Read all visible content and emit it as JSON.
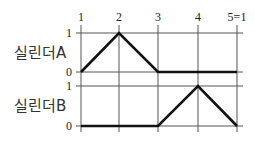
{
  "diagram": {
    "type": "displacement-step-diagram",
    "steps": [
      "1",
      "2",
      "3",
      "4",
      "5=1"
    ],
    "cylinders": [
      {
        "name": "실린더A",
        "levels": {
          "high": "1",
          "low": "0"
        },
        "states": [
          0,
          1,
          0,
          0,
          0
        ]
      },
      {
        "name": "실린더B",
        "levels": {
          "high": "1",
          "low": "0"
        },
        "states": [
          0,
          0,
          0,
          1,
          0
        ]
      }
    ],
    "colors": {
      "trace": "#111111",
      "grid": "#555555",
      "text": "#222222"
    }
  }
}
